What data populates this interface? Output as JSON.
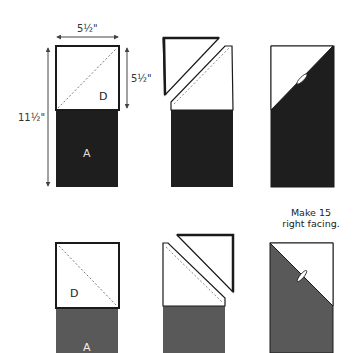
{
  "colors": {
    "dark_fabric": "#1e1e1e",
    "medium_fabric": "#595959",
    "light_fabric": "#ffffff",
    "outline": "#1a1a1a",
    "dimension_line": "#444444"
  },
  "dimensions": {
    "width_label": "5½\"",
    "square_height_label": "5½\"",
    "total_height_label": "11½\""
  },
  "row1": {
    "step1": {
      "top_label": "D",
      "bottom_label": "A"
    },
    "caption_line1": "Make 15",
    "caption_line2": "right facing."
  },
  "row2": {
    "step1": {
      "top_label": "D",
      "bottom_label": "A"
    }
  }
}
